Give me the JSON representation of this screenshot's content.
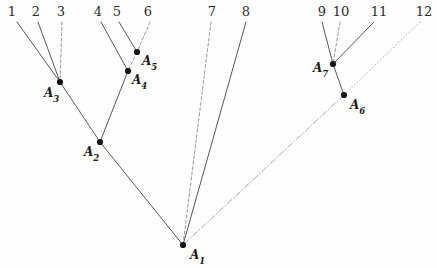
{
  "figure": {
    "width": 437,
    "height": 268,
    "background_color": "#fefefe",
    "line_color": "#3a3a3a",
    "node_color": "#141414"
  },
  "leaves": [
    {
      "label": "1",
      "label_x": 12,
      "label_y": 5,
      "tip_x": 17,
      "tip_y": 22,
      "parent": "A3",
      "style": "solid"
    },
    {
      "label": "2",
      "label_x": 36,
      "label_y": 5,
      "tip_x": 38,
      "tip_y": 22,
      "parent": "A3",
      "style": "solid"
    },
    {
      "label": "3",
      "label_x": 61,
      "label_y": 5,
      "tip_x": 62,
      "tip_y": 22,
      "parent": "A3",
      "style": "dashed"
    },
    {
      "label": "4",
      "label_x": 98,
      "label_y": 5,
      "tip_x": 101,
      "tip_y": 22,
      "parent": "A4",
      "style": "solid"
    },
    {
      "label": "5",
      "label_x": 117,
      "label_y": 5,
      "tip_x": 119,
      "tip_y": 22,
      "parent": "A5",
      "style": "solid"
    },
    {
      "label": "6",
      "label_x": 148,
      "label_y": 5,
      "tip_x": 150,
      "tip_y": 22,
      "parent": "A5",
      "style": "dashed"
    },
    {
      "label": "7",
      "label_x": 212,
      "label_y": 5,
      "tip_x": 211,
      "tip_y": 22,
      "parent": "A1",
      "style": "dashed"
    },
    {
      "label": "8",
      "label_x": 246,
      "label_y": 5,
      "tip_x": 246,
      "tip_y": 22,
      "parent": "A1",
      "style": "solid"
    },
    {
      "label": "9",
      "label_x": 322,
      "label_y": 5,
      "tip_x": 322,
      "tip_y": 22,
      "parent": "A7",
      "style": "solid"
    },
    {
      "label": "10",
      "label_x": 341,
      "label_y": 5,
      "tip_x": 340,
      "tip_y": 22,
      "parent": "A7",
      "style": "dashed"
    },
    {
      "label": "11",
      "label_x": 379,
      "label_y": 5,
      "tip_x": 374,
      "tip_y": 22,
      "parent": "A7",
      "style": "solid"
    },
    {
      "label": "12",
      "label_x": 424,
      "label_y": 5,
      "tip_x": 420,
      "tip_y": 22,
      "parent": "A6",
      "style": "dotted"
    }
  ],
  "nodes": [
    {
      "id": "A1",
      "label": "A",
      "subscript": "1",
      "x": 183,
      "y": 245,
      "label_x": 190,
      "label_y": 249,
      "parent": null
    },
    {
      "id": "A2",
      "label": "A",
      "subscript": "2",
      "x": 100,
      "y": 142,
      "label_x": 84,
      "label_y": 146,
      "parent": "A1",
      "style": "solid"
    },
    {
      "id": "A3",
      "label": "A",
      "subscript": "3",
      "x": 60,
      "y": 82,
      "label_x": 44,
      "label_y": 87,
      "parent": "A2",
      "style": "solid"
    },
    {
      "id": "A4",
      "label": "A",
      "subscript": "4",
      "x": 128,
      "y": 71,
      "label_x": 132,
      "label_y": 74,
      "parent": "A2",
      "style": "solid"
    },
    {
      "id": "A5",
      "label": "A",
      "subscript": "5",
      "x": 137,
      "y": 52,
      "label_x": 142,
      "label_y": 55,
      "parent": "A4",
      "style": "dashed"
    },
    {
      "id": "A6",
      "label": "A",
      "subscript": "6",
      "x": 344,
      "y": 95,
      "label_x": 350,
      "label_y": 99,
      "parent": "A1",
      "style": "dashdot"
    },
    {
      "id": "A7",
      "label": "A",
      "subscript": "7",
      "x": 333,
      "y": 64,
      "label_x": 313,
      "label_y": 62,
      "parent": "A6",
      "style": "solid"
    }
  ],
  "accessibility": {
    "description": "A cladogram with twelve numbered terminal tips and seven internal nodes labelled A1 through A7."
  }
}
